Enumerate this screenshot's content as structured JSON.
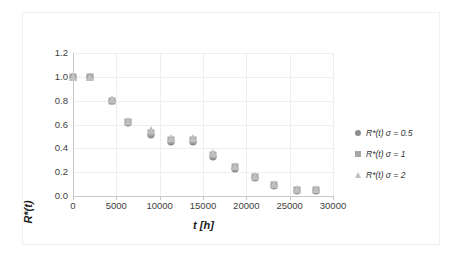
{
  "chart_data": {
    "type": "scatter",
    "title": "",
    "xlabel": "t [h]",
    "ylabel": "R*(t)",
    "xlim": [
      0,
      30000
    ],
    "ylim": [
      0.0,
      1.2
    ],
    "xticks": [
      "0",
      "5000",
      "10000",
      "15000",
      "20000",
      "25000",
      "30000"
    ],
    "xtick_values": [
      0,
      5000,
      10000,
      15000,
      20000,
      25000,
      30000
    ],
    "yticks": [
      "0.0",
      "0.2",
      "0.4",
      "0.6",
      "0.8",
      "1.0",
      "1.2"
    ],
    "ytick_values": [
      0.0,
      0.2,
      0.4,
      0.6,
      0.8,
      1.0,
      1.2
    ],
    "grid": true,
    "legend_position": "right",
    "x": [
      0,
      2000,
      4500,
      6300,
      9000,
      11300,
      13800,
      16200,
      18700,
      21000,
      23200,
      25800,
      28000
    ],
    "series": [
      {
        "name": "R*(t) σ = 0.5",
        "marker": "circle",
        "color": "#8c8c8c",
        "values": [
          1.0,
          1.0,
          0.8,
          0.61,
          0.51,
          0.45,
          0.45,
          0.33,
          0.23,
          0.15,
          0.08,
          0.04,
          0.04
        ]
      },
      {
        "name": "R*(t) σ = 1",
        "marker": "square",
        "color": "#a6a6a6",
        "values": [
          1.0,
          1.0,
          0.8,
          0.62,
          0.53,
          0.47,
          0.47,
          0.34,
          0.24,
          0.16,
          0.09,
          0.05,
          0.05
        ]
      },
      {
        "name": "R*(t) σ = 2",
        "marker": "triangle",
        "color": "#bfbfbf",
        "values": [
          1.0,
          1.0,
          0.81,
          0.63,
          0.55,
          0.49,
          0.49,
          0.36,
          0.25,
          0.17,
          0.1,
          0.06,
          0.06
        ]
      }
    ]
  },
  "legend": {
    "items": [
      {
        "label": "R*(t) σ = 0.5",
        "marker": "circle"
      },
      {
        "label": "R*(t) σ = 1",
        "marker": "square"
      },
      {
        "label": "R*(t) σ = 2",
        "marker": "triangle"
      }
    ]
  },
  "axes": {
    "x_title": "t [h]",
    "y_title": "R*(t)"
  }
}
